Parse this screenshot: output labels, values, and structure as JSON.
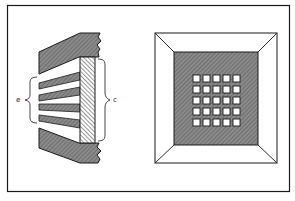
{
  "figure": {
    "left_panel": {
      "description": "cross-section of grid with angled bars and hatched band",
      "label_left": "e",
      "label_right": "c"
    },
    "right_panel": {
      "description": "beveled square frame with dark inner field and grid of apertures",
      "grid_rows": 5,
      "grid_cols": 5
    }
  },
  "colors": {
    "stroke": "#1a1a1a",
    "dark_fill": "#7a7a7a",
    "background": "#ffffff"
  }
}
